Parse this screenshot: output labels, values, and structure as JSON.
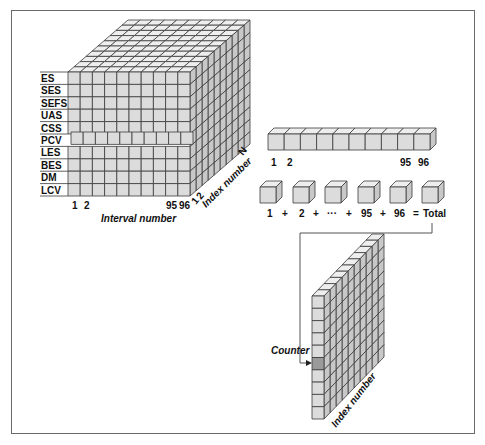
{
  "colors": {
    "cell_front": "#dcdcdc",
    "cell_top": "#eeeeee",
    "cell_side": "#c8c8c8",
    "grid_line": "#3a3a3a",
    "highlight_cell": "#9a9a9a",
    "frame": "#6a6a6a"
  },
  "cube": {
    "row_labels": [
      "ES",
      "SES",
      "SEFS",
      "UAS",
      "CSS",
      "PCV",
      "LES",
      "BES",
      "DM",
      "LCV"
    ],
    "recessed_row": "PCV",
    "interval_ticks": [
      "1",
      "2",
      "95",
      "96"
    ],
    "interval_axis_label": "Interval number",
    "index_ticks": [
      "1",
      "2",
      "N"
    ],
    "index_axis_label": "Index number"
  },
  "interval_row": {
    "cells": 10,
    "tick_labels": [
      "1",
      "2",
      "95",
      "96"
    ]
  },
  "sum_row": {
    "cubes": 6,
    "equation": [
      "1",
      "+",
      "2",
      "+",
      "···",
      "+",
      "95",
      "+",
      "96",
      "=",
      "Total"
    ]
  },
  "counter_wall": {
    "rows": 10,
    "highlighted_row": 6,
    "counter_label": "Counter",
    "index_axis_label": "Index number"
  }
}
